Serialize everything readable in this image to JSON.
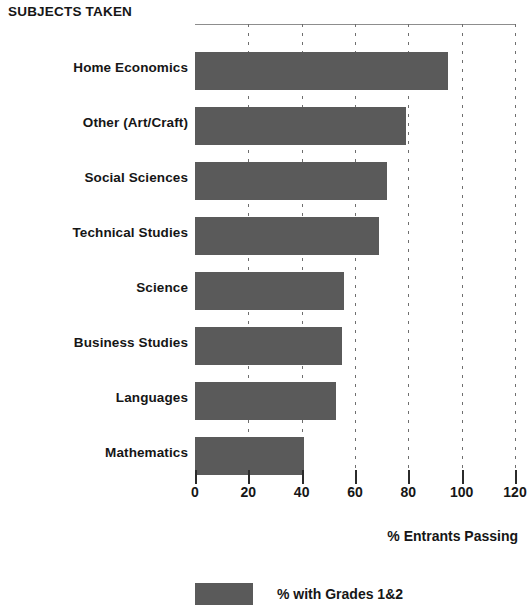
{
  "chart_data": {
    "type": "bar",
    "orientation": "horizontal",
    "title": "SUBJECTS TAKEN",
    "xlabel": "% Entrants Passing",
    "ylabel": "",
    "xlim": [
      0,
      120
    ],
    "xticks": [
      0,
      20,
      40,
      60,
      80,
      100,
      120
    ],
    "xtick_labels": [
      "0",
      "20",
      "40",
      "60",
      "80",
      "100",
      "120"
    ],
    "grid": true,
    "grid_style": "dotted-vertical",
    "legend": {
      "position": "bottom",
      "entries": [
        {
          "label": "% with Grades 1&2",
          "color": "#5a5a5a"
        }
      ]
    },
    "categories": [
      "Home Economics",
      "Other (Art/Craft)",
      "Social Sciences",
      "Technical Studies",
      "Science",
      "Business Studies",
      "Languages",
      "Mathematics"
    ],
    "series": [
      {
        "name": "% with Grades 1&2",
        "color": "#5a5a5a",
        "values": [
          95,
          79,
          72,
          69,
          56,
          55,
          53,
          41
        ]
      }
    ]
  },
  "bar_color": "#5a5a5a",
  "axis_color": "#2b2b2b"
}
